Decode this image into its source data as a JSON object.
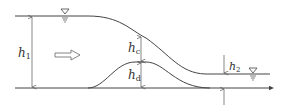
{
  "diagram": {
    "type": "hydraulic-flow-over-hump",
    "colors": {
      "line": "#444444",
      "text": "#333333",
      "background": "#ffffff"
    },
    "labels": {
      "h1": {
        "main": "h",
        "sub": "1"
      },
      "hc": {
        "main": "h",
        "sub": "c"
      },
      "hd": {
        "main": "h",
        "sub": "d"
      },
      "h2": {
        "main": "h",
        "sub": "2"
      }
    },
    "symbols": {
      "upstream_water_surface": "water-level-triangle",
      "downstream_water_surface": "water-level-triangle",
      "flow_direction": "hollow-arrow-right"
    }
  }
}
